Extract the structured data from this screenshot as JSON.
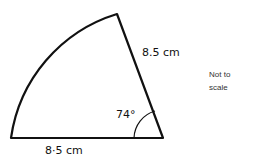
{
  "diagram": {
    "shape": "sector",
    "radius_label_top": "8.5 cm",
    "radius_label_bottom": "8·5 cm",
    "angle_label": "74°",
    "note_line1": "Not to",
    "note_line2": "scale",
    "colors": {
      "stroke": "#111111",
      "background": "#ffffff",
      "note_text": "#333333"
    }
  }
}
